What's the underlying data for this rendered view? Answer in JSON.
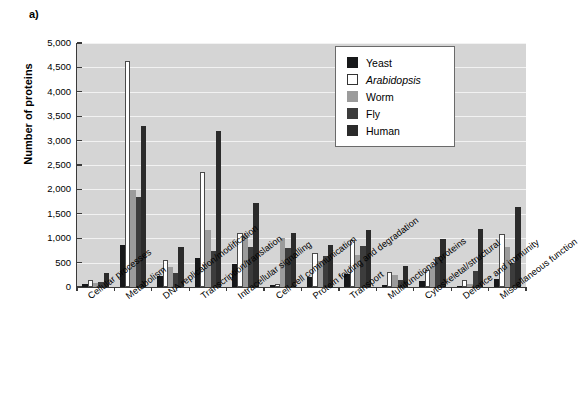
{
  "panel": {
    "label": "a)"
  },
  "legend": {
    "entries": [
      {
        "key": "yeast",
        "label": "Yeast",
        "color": "#17181a",
        "italic": false
      },
      {
        "key": "arabidopsis",
        "label": "Arabidopsis",
        "color": "#ffffff",
        "italic": true
      },
      {
        "key": "worm",
        "label": "Worm",
        "color": "#9b9b9b",
        "italic": false
      },
      {
        "key": "fly",
        "label": "Fly",
        "color": "#3c3c3c",
        "italic": false
      },
      {
        "key": "human",
        "label": "Human",
        "color": "#2b2b2b",
        "italic": false
      }
    ]
  },
  "chart_data": {
    "type": "bar",
    "title": "",
    "xlabel": "",
    "ylabel": "Number of proteins",
    "ylim": [
      0,
      5000
    ],
    "yticks": [
      0,
      500,
      1000,
      1500,
      2000,
      2500,
      3000,
      3500,
      4000,
      4500,
      5000
    ],
    "ytick_labels": [
      "0",
      "500",
      "1,000",
      "1,500",
      "2,000",
      "2,500",
      "3,000",
      "3,500",
      "4,000",
      "4,500",
      "5,000"
    ],
    "grid": true,
    "grid_axis": "y",
    "legend_position": "top-right",
    "plot_background": "#d5d5d5",
    "categories": [
      "Cellular processes",
      "Metabolism",
      "DNA replication/modification",
      "Transcription/translation",
      "Intracellular signalling",
      "Cell-cell communication",
      "Protein folding and degradation",
      "Transport",
      "Multifunctional proteins",
      "Cytoskeletal/structural",
      "Defence and immunity",
      "Miscellaneous function"
    ],
    "series": [
      {
        "name": "Yeast",
        "color": "#17181a",
        "values": [
          60,
          870,
          220,
          590,
          480,
          40,
          200,
          270,
          50,
          120,
          30,
          170
        ]
      },
      {
        "name": "Arabidopsis",
        "color": "#ffffff",
        "values": [
          150,
          4640,
          560,
          2360,
          1100,
          60,
          700,
          960,
          310,
          350,
          150,
          1090
        ]
      },
      {
        "name": "Worm",
        "color": "#9b9b9b",
        "values": [
          90,
          1990,
          420,
          1170,
          1070,
          1000,
          530,
          650,
          250,
          400,
          70,
          830
        ]
      },
      {
        "name": "Fly",
        "color": "#3c3c3c",
        "values": [
          100,
          1850,
          290,
          730,
          810,
          800,
          640,
          840,
          150,
          620,
          330,
          490
        ]
      },
      {
        "name": "Human",
        "color": "#2b2b2b",
        "values": [
          290,
          3290,
          820,
          3190,
          1730,
          1100,
          870,
          1170,
          440,
          980,
          1180,
          1640
        ]
      }
    ]
  }
}
